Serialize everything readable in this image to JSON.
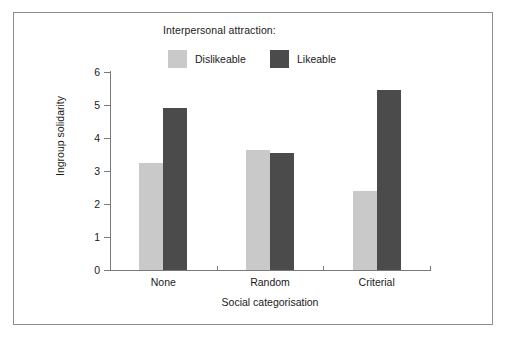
{
  "figure": {
    "border_color": "#8d8d8d",
    "background": "#ffffff"
  },
  "legend": {
    "title": "Interpersonal attraction:",
    "position": "top-center",
    "entries": [
      {
        "label": "Dislikeable",
        "color": "#c9c9c9"
      },
      {
        "label": "Likeable",
        "color": "#4b4b4b"
      }
    ]
  },
  "chart_data": {
    "type": "bar",
    "title": "",
    "subtitle": "",
    "categories": [
      "None",
      "Random",
      "Criterial"
    ],
    "series": [
      {
        "name": "Dislikeable",
        "color": "#c9c9c9",
        "values": [
          3.25,
          3.65,
          2.4
        ]
      },
      {
        "name": "Likeable",
        "color": "#4b4b4b",
        "values": [
          4.9,
          3.55,
          5.45
        ]
      }
    ],
    "xlabel": "Social categorisation",
    "ylabel": "Ingroup solidarity",
    "ylim": [
      0,
      6
    ],
    "yticks": [
      0,
      1,
      2,
      3,
      4,
      5,
      6
    ],
    "ytick_labels": [
      "0",
      "1",
      "2",
      "3",
      "4",
      "5",
      "6"
    ],
    "grid": false,
    "legend_title": "Interpersonal attraction:"
  }
}
